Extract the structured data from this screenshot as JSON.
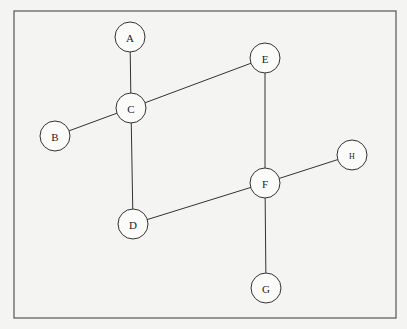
{
  "diagram": {
    "type": "undirected-graph",
    "frame": {
      "x": 14,
      "y": 11,
      "width": 382,
      "height": 307
    },
    "node_radius": 15,
    "nodes": [
      {
        "id": "A",
        "label": "A",
        "x": 130,
        "y": 37
      },
      {
        "id": "B",
        "label": "B",
        "x": 55,
        "y": 136
      },
      {
        "id": "C",
        "label": "C",
        "x": 131,
        "y": 108
      },
      {
        "id": "D",
        "label": "D",
        "x": 133,
        "y": 224
      },
      {
        "id": "E",
        "label": "E",
        "x": 265,
        "y": 58
      },
      {
        "id": "F",
        "label": "F",
        "x": 265,
        "y": 183
      },
      {
        "id": "G",
        "label": "G",
        "x": 266,
        "y": 288
      },
      {
        "id": "H",
        "label": "H",
        "x": 352,
        "y": 155,
        "small": true
      }
    ],
    "edges": [
      [
        "A",
        "C"
      ],
      [
        "B",
        "C"
      ],
      [
        "C",
        "E"
      ],
      [
        "C",
        "D"
      ],
      [
        "E",
        "F"
      ],
      [
        "D",
        "F"
      ],
      [
        "F",
        "H"
      ],
      [
        "F",
        "G"
      ]
    ]
  },
  "colors": {
    "background": "#f4f4f2",
    "stroke": "#333333",
    "node_fill": "#fbfbfa"
  }
}
